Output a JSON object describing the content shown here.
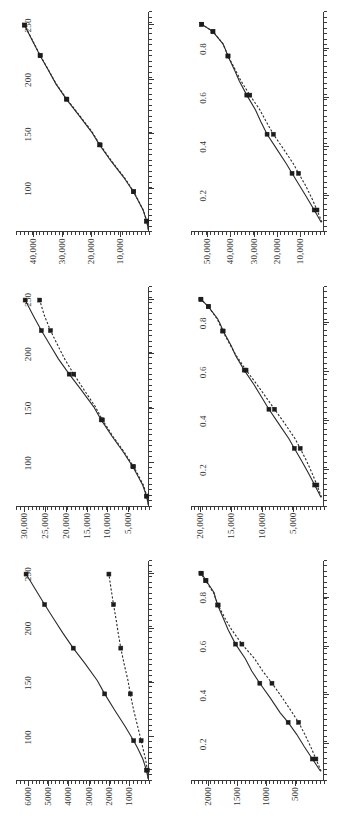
{
  "figure": {
    "orientation": "rotated-90-ccw",
    "rows": 2,
    "cols": 3,
    "series_names": [
      "solid-line-series",
      "dotted-line-series"
    ],
    "ink_color": "#2b2b2b"
  },
  "chart_data": [
    {
      "id": "panel-top-left",
      "type": "line",
      "title": "",
      "xlabel": "",
      "ylabel": "",
      "xlim": [
        60,
        262
      ],
      "ylim": [
        0,
        6600
      ],
      "xticks": [
        100,
        150,
        200,
        250
      ],
      "xticklabels": [
        "100",
        "150",
        "200",
        "250"
      ],
      "yticks": [
        1000,
        2000,
        3000,
        4000,
        5000,
        6000
      ],
      "yticklabels": [
        "1000",
        "2000",
        "3000",
        "4000",
        "5000",
        "6000"
      ],
      "grid": false,
      "legend": "none",
      "series": [
        {
          "name": "solid-line-series",
          "style": "solid",
          "x": [
            62,
            70,
            80,
            90,
            97,
            110,
            125,
            140,
            152,
            168,
            182,
            196,
            208,
            222,
            236,
            250
          ],
          "values": [
            40,
            130,
            300,
            560,
            760,
            1180,
            1700,
            2200,
            2560,
            3180,
            3760,
            4280,
            4700,
            5180,
            5640,
            6100
          ]
        },
        {
          "name": "dotted-line-series",
          "style": "dotted",
          "x": [
            62,
            70,
            80,
            90,
            97,
            110,
            125,
            140,
            152,
            168,
            182,
            196,
            208,
            222,
            236,
            250
          ],
          "values": [
            30,
            80,
            170,
            300,
            390,
            560,
            760,
            930,
            1040,
            1240,
            1400,
            1530,
            1630,
            1760,
            1880,
            1990
          ]
        }
      ]
    },
    {
      "id": "panel-top-middle",
      "type": "line",
      "title": "",
      "xlabel": "",
      "ylabel": "",
      "xlim": [
        60,
        262
      ],
      "ylim": [
        0,
        32000
      ],
      "xticks": [
        100,
        150,
        200,
        250
      ],
      "xticklabels": [
        "100",
        "150",
        "200",
        "250"
      ],
      "yticks": [
        5000,
        10000,
        15000,
        20000,
        25000,
        30000
      ],
      "yticklabels": [
        "5,000",
        "10,000",
        "15,000",
        "20,000",
        "25,000",
        "30,000"
      ],
      "grid": false,
      "legend": "none",
      "series": [
        {
          "name": "solid-line-series",
          "style": "solid",
          "x": [
            62,
            70,
            80,
            90,
            97,
            110,
            125,
            140,
            152,
            168,
            182,
            196,
            208,
            222,
            236,
            250
          ],
          "values": [
            150,
            600,
            1500,
            2900,
            3900,
            6100,
            8900,
            11500,
            13300,
            16400,
            19200,
            21800,
            23700,
            25900,
            27900,
            29800
          ]
        },
        {
          "name": "dotted-line-series",
          "style": "dotted",
          "x": [
            62,
            70,
            80,
            90,
            97,
            110,
            125,
            140,
            152,
            168,
            182,
            196,
            208,
            222,
            236,
            250
          ],
          "values": [
            130,
            520,
            1330,
            2700,
            3700,
            5900,
            8700,
            11200,
            12900,
            15700,
            18100,
            20300,
            21900,
            23700,
            25200,
            26300
          ]
        }
      ]
    },
    {
      "id": "panel-top-right",
      "type": "line",
      "title": "",
      "xlabel": "",
      "ylabel": "",
      "xlim": [
        60,
        262
      ],
      "ylim": [
        0,
        46000
      ],
      "xticks": [
        100,
        150,
        200,
        250
      ],
      "xticklabels": [
        "100",
        "150",
        "200",
        "250"
      ],
      "yticks": [
        10000,
        20000,
        30000,
        40000
      ],
      "yticklabels": [
        "10,000",
        "20,000",
        "30,000",
        "40,000"
      ],
      "grid": false,
      "legend": "none",
      "series": [
        {
          "name": "solid-line-series",
          "style": "solid",
          "x": [
            62,
            70,
            80,
            90,
            97,
            110,
            125,
            140,
            152,
            168,
            182,
            196,
            208,
            222,
            236,
            250
          ],
          "values": [
            200,
            800,
            2000,
            4000,
            5400,
            8700,
            13100,
            17100,
            19900,
            24500,
            28600,
            32200,
            34700,
            37700,
            40400,
            43100
          ]
        },
        {
          "name": "dotted-line-series",
          "style": "dotted",
          "x": [
            62,
            70,
            80,
            90,
            97,
            110,
            125,
            140,
            152,
            168,
            182,
            196,
            208,
            222,
            236,
            250
          ],
          "values": [
            200,
            780,
            1950,
            3900,
            5300,
            8500,
            12900,
            16900,
            19700,
            24300,
            28400,
            32100,
            34600,
            37600,
            40300,
            43000
          ]
        }
      ]
    },
    {
      "id": "panel-bottom-left",
      "type": "line",
      "title": "",
      "xlabel": "",
      "ylabel": "",
      "xlim": [
        0.05,
        0.95
      ],
      "ylim": [
        0,
        2300
      ],
      "xticks": [
        0.2,
        0.4,
        0.6,
        0.8
      ],
      "xticklabels": [
        "0.2",
        "0.4",
        "0.6",
        "0.8"
      ],
      "yticks": [
        500,
        1000,
        1500,
        2000
      ],
      "yticklabels": [
        "500",
        "1000",
        "1500",
        "2000"
      ],
      "grid": false,
      "legend": "none",
      "series": [
        {
          "name": "solid-line-series",
          "style": "solid",
          "x": [
            0.09,
            0.14,
            0.19,
            0.24,
            0.29,
            0.33,
            0.39,
            0.45,
            0.5,
            0.55,
            0.61,
            0.67,
            0.71,
            0.77,
            0.8,
            0.82,
            0.87,
            0.9
          ],
          "values": [
            60,
            200,
            340,
            470,
            620,
            760,
            930,
            1110,
            1250,
            1360,
            1530,
            1660,
            1730,
            1840,
            1880,
            1900,
            2040,
            2120
          ]
        },
        {
          "name": "dotted-line-series",
          "style": "dotted",
          "x": [
            0.09,
            0.14,
            0.19,
            0.24,
            0.29,
            0.33,
            0.39,
            0.45,
            0.5,
            0.55,
            0.61,
            0.67,
            0.71,
            0.77,
            0.8,
            0.82,
            0.87,
            0.9
          ],
          "values": [
            50,
            140,
            230,
            330,
            440,
            550,
            720,
            900,
            1060,
            1200,
            1420,
            1600,
            1700,
            1830,
            1880,
            1910,
            2050,
            2130
          ]
        }
      ]
    },
    {
      "id": "panel-bottom-middle",
      "type": "line",
      "title": "",
      "xlabel": "",
      "ylabel": "",
      "xlim": [
        0.05,
        0.95
      ],
      "ylim": [
        0,
        21500
      ],
      "xticks": [
        0.2,
        0.4,
        0.6,
        0.8
      ],
      "xticklabels": [
        "0.2",
        "0.4",
        "0.6",
        "0.8"
      ],
      "yticks": [
        5000,
        10000,
        15000,
        20000
      ],
      "yticklabels": [
        "5,000",
        "10,000",
        "15,000",
        "20,000"
      ],
      "grid": false,
      "legend": "none",
      "series": [
        {
          "name": "solid-line-series",
          "style": "solid",
          "x": [
            0.09,
            0.14,
            0.19,
            0.24,
            0.29,
            0.33,
            0.39,
            0.45,
            0.5,
            0.55,
            0.61,
            0.67,
            0.71,
            0.77,
            0.8,
            0.82,
            0.87,
            0.9
          ],
          "values": [
            500,
            1500,
            2550,
            3650,
            4800,
            5700,
            7300,
            8900,
            10100,
            11300,
            12900,
            14300,
            15000,
            16300,
            16800,
            17200,
            18700,
            19900
          ]
        },
        {
          "name": "dotted-line-series",
          "style": "dotted",
          "x": [
            0.09,
            0.14,
            0.19,
            0.24,
            0.29,
            0.33,
            0.39,
            0.45,
            0.5,
            0.55,
            0.61,
            0.67,
            0.71,
            0.77,
            0.8,
            0.82,
            0.87,
            0.9
          ],
          "values": [
            400,
            1150,
            1950,
            2850,
            3850,
            4700,
            6300,
            8000,
            9400,
            10800,
            12600,
            14200,
            15100,
            16400,
            16900,
            17300,
            18700,
            19900
          ]
        }
      ]
    },
    {
      "id": "panel-bottom-right",
      "type": "line",
      "title": "",
      "xlabel": "",
      "ylabel": "",
      "xlim": [
        0.05,
        0.95
      ],
      "ylim": [
        0,
        57000
      ],
      "xticks": [
        0.2,
        0.4,
        0.6,
        0.8
      ],
      "xticklabels": [
        "0.2",
        "0.4",
        "0.6",
        "0.8"
      ],
      "yticks": [
        10000,
        20000,
        30000,
        40000,
        50000
      ],
      "yticklabels": [
        "10,000",
        "20,000",
        "30,000",
        "40,000",
        "50,000"
      ],
      "grid": false,
      "legend": "none",
      "series": [
        {
          "name": "solid-line-series",
          "style": "solid",
          "x": [
            0.09,
            0.14,
            0.19,
            0.24,
            0.29,
            0.33,
            0.39,
            0.45,
            0.5,
            0.55,
            0.61,
            0.67,
            0.71,
            0.77,
            0.8,
            0.82,
            0.87,
            0.9
          ],
          "values": [
            1200,
            4200,
            7300,
            10500,
            13700,
            16200,
            20300,
            24400,
            27000,
            29400,
            33100,
            36400,
            38200,
            41200,
            42400,
            43300,
            47600,
            52400
          ]
        },
        {
          "name": "dotted-line-series",
          "style": "dotted",
          "x": [
            0.09,
            0.14,
            0.19,
            0.24,
            0.29,
            0.33,
            0.39,
            0.45,
            0.5,
            0.55,
            0.61,
            0.67,
            0.71,
            0.77,
            0.8,
            0.82,
            0.87,
            0.9
          ],
          "values": [
            900,
            3000,
            5300,
            7900,
            10900,
            13200,
            17400,
            21700,
            24700,
            27500,
            31800,
            35700,
            37800,
            41100,
            42400,
            43300,
            47600,
            52400
          ]
        }
      ]
    }
  ]
}
